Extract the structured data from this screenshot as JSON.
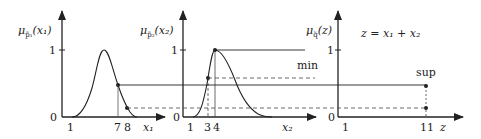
{
  "panels": [
    {
      "ylabel": "μ",
      "ylabel_sub": "p̃₁",
      "ylabel_arg": "(x₁)",
      "y_tick_1": "1",
      "y_tick_0": "0",
      "x_ticks": [
        "1",
        "7",
        "8"
      ],
      "x_axis_label": "x₁"
    },
    {
      "ylabel": "μ",
      "ylabel_sub": "p̃₂",
      "ylabel_arg": "(x₂)",
      "y_tick_1": "1",
      "y_tick_0": "0",
      "x_ticks": [
        "1",
        "3",
        "4"
      ],
      "x_axis_label": "x₂"
    },
    {
      "ylabel": "μ",
      "ylabel_sub": "q̃",
      "ylabel_arg": "(z)",
      "y_tick_1": "1",
      "y_tick_0": "0",
      "x_ticks": [
        "1",
        "11"
      ],
      "x_axis_label": "z"
    }
  ],
  "annotations": {
    "equation": "z = x₁ + x₂",
    "min_label": "min",
    "sup_label": "sup"
  },
  "colors": {
    "stroke": "#222222",
    "background": "#ffffff"
  }
}
